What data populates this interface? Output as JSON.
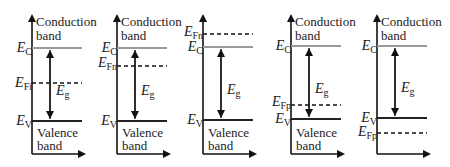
{
  "colors": {
    "axis": "#111111",
    "conduction_edge": "#9a9a9a",
    "valence_edge": "#222222",
    "fermi": "#111111",
    "arrow": "#111111"
  },
  "labels": {
    "conduction": "Conduction",
    "band": "band",
    "valence": "Valence",
    "eg": "E",
    "eg_sub": "g",
    "ec": "E",
    "ec_sub": "C",
    "ev": "E",
    "ev_sub": "V"
  },
  "panels": [
    {
      "id": "intrinsic",
      "axis_x": 32,
      "fermi_label": "E",
      "fermi_sub": "Fi",
      "ec_y": 48,
      "ev_y": 121,
      "ef_y": 83,
      "text_top": true,
      "text_bottom": true
    },
    {
      "id": "n-type",
      "axis_x": 117,
      "fermi_label": "E",
      "fermi_sub": "Fn",
      "ec_y": 48,
      "ev_y": 121,
      "ef_y": 66,
      "text_top": true,
      "text_bottom": true
    },
    {
      "id": "degenerate-n",
      "axis_x": 203,
      "fermi_label": "E",
      "fermi_sub": "Fn",
      "ec_y": 47,
      "ev_y": 120,
      "ef_y": 34,
      "text_top": false,
      "text_bottom": true
    },
    {
      "id": "p-type",
      "axis_x": 291,
      "fermi_label": "E",
      "fermi_sub": "Fp",
      "ec_y": 46,
      "ev_y": 119,
      "ef_y": 105,
      "text_top": true,
      "text_bottom": true
    },
    {
      "id": "degenerate-p",
      "axis_x": 377,
      "fermi_label": "E",
      "fermi_sub": "Fp",
      "ec_y": 46,
      "ev_y": 118,
      "ef_y": 133,
      "text_top": true,
      "text_bottom": false
    }
  ]
}
